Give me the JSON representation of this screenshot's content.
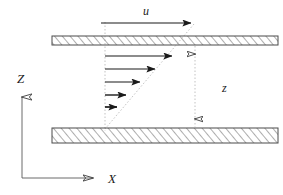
{
  "figure": {
    "background_color": "#ffffff",
    "line_color": "#1a1a1a",
    "hatch_color": "#555555",
    "dotted_color": "#b0b0b0",
    "width": 283,
    "height": 195
  },
  "labels": {
    "u": "u",
    "z_dimension": "z",
    "axis_z": "Z",
    "axis_x": "X"
  },
  "plates": {
    "top": {
      "name": "moving-plate",
      "x": 52,
      "y": 36,
      "width": 226,
      "height": 9,
      "hatch_pattern": "diagonal"
    },
    "bottom": {
      "name": "stationary-plate",
      "x": 52,
      "y": 128,
      "width": 226,
      "height": 15,
      "hatch_pattern": "diagonal"
    }
  },
  "velocity_arrow": {
    "name": "plate-velocity-arrow",
    "x1": 101,
    "y1": 23,
    "x2": 194,
    "y2": 23
  },
  "profile_arrows": [
    {
      "index": 1,
      "x1": 105,
      "y": 56,
      "x2": 177
    },
    {
      "index": 2,
      "x1": 105,
      "y": 69,
      "x2": 160
    },
    {
      "index": 3,
      "x1": 105,
      "y": 82,
      "x2": 145
    },
    {
      "index": 4,
      "x1": 105,
      "y": 95,
      "x2": 131
    },
    {
      "index": 5,
      "x1": 105,
      "y": 107,
      "x2": 121
    }
  ],
  "profile_envelope": {
    "name": "linear-velocity-profile-line",
    "x1": 194,
    "y1": 24,
    "x2": 105,
    "y2": 128
  },
  "baseline_guide": {
    "name": "wall-reference-dotted-line",
    "x": 105,
    "y1": 23,
    "y2": 130
  },
  "dimension_line": {
    "name": "gap-height-dimension",
    "x": 195,
    "y_top": 45,
    "y_bottom": 128
  },
  "axes": {
    "origin_x": 22,
    "origin_y": 178,
    "z_axis_top": 86,
    "x_axis_right": 103
  }
}
